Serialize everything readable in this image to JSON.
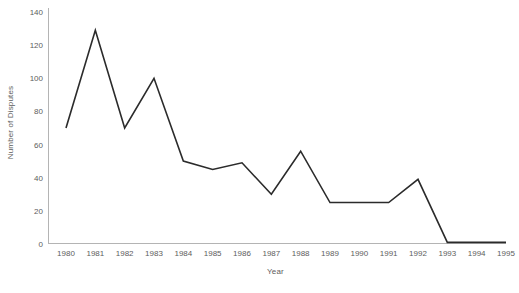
{
  "chart_data": {
    "type": "line",
    "title": "",
    "xlabel": "Year",
    "ylabel": "Number of Disputes",
    "categories": [
      "1980",
      "1981",
      "1982",
      "1983",
      "1984",
      "1985",
      "1986",
      "1987",
      "1988",
      "1989",
      "1990",
      "1991",
      "1992",
      "1993",
      "1994",
      "1995"
    ],
    "x": [
      1980,
      1981,
      1982,
      1983,
      1984,
      1985,
      1986,
      1987,
      1988,
      1989,
      1990,
      1991,
      1992,
      1993,
      1994,
      1995
    ],
    "values": [
      70,
      129,
      70,
      100,
      50,
      45,
      49,
      30,
      56,
      25,
      25,
      25,
      39,
      1,
      1,
      1
    ],
    "series": [
      {
        "name": "Number of Disputes",
        "values": [
          70,
          129,
          70,
          100,
          50,
          45,
          49,
          30,
          56,
          25,
          25,
          25,
          39,
          1,
          1,
          1
        ]
      }
    ],
    "xlim": [
      1980,
      1995
    ],
    "ylim": [
      0,
      140
    ],
    "yticks": [
      0,
      20,
      40,
      60,
      80,
      100,
      120,
      140
    ],
    "ytick_labels": [
      "0",
      "20",
      "40",
      "60",
      "80",
      "100",
      "120",
      "140"
    ],
    "xticks": [
      1980,
      1981,
      1982,
      1983,
      1984,
      1985,
      1986,
      1987,
      1988,
      1989,
      1990,
      1991,
      1992,
      1993,
      1994,
      1995
    ],
    "grid": false,
    "legend": false,
    "legend_position": "none",
    "line_color": "#2b2b2b",
    "line_width": 1.6,
    "markers": "none",
    "axis_color": "#b4b4b4",
    "tick_label_color": "#5d5d5d",
    "background_color": "#ffffff"
  }
}
